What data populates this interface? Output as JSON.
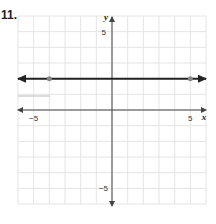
{
  "problem": {
    "number": "11."
  },
  "chart_data": {
    "type": "line",
    "title": "",
    "xlabel": "x",
    "ylabel": "y",
    "xlim": [
      -6,
      6
    ],
    "ylim": [
      -6,
      6
    ],
    "grid": true,
    "tick_labels": {
      "x": [
        "-5",
        "5"
      ],
      "y": [
        "5",
        "-5"
      ]
    },
    "series": [
      {
        "name": "y = 2",
        "equation": "y = 2",
        "x": [
          -6,
          6
        ],
        "y": [
          2,
          2
        ],
        "arrows": "both",
        "color": "#222222",
        "marked_points": [
          {
            "x": -4,
            "y": 2
          },
          {
            "x": 5,
            "y": 2
          }
        ]
      }
    ],
    "colors": {
      "grid": "#e4e4e4",
      "axis": "#444444",
      "line": "#222222",
      "point": "#888888",
      "stray_mark": "#bbbbbb"
    }
  }
}
